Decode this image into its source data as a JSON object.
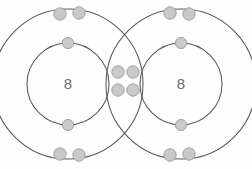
{
  "figure": {
    "background_color": "#fdfdfd",
    "ring_color": "#58585a",
    "electron_fill": "#c9c9c9",
    "electron_stroke": "#9a9a9a",
    "label_color": "#6d6d6f"
  },
  "atoms": {
    "left": {
      "name": "oxygen-atom-left",
      "nucleus_label": "8",
      "nucleus_cx": 68,
      "nucleus_cy": 84,
      "inner_shell_radius": 41,
      "outer_shell_radius": 75
    },
    "right": {
      "name": "oxygen-atom-right",
      "nucleus_label": "8",
      "nucleus_cx": 181,
      "nucleus_cy": 84,
      "inner_shell_radius": 41,
      "outer_shell_radius": 75
    }
  },
  "electrons": {
    "left_inner": [
      {
        "cx": 68,
        "cy": 43,
        "r": 5.6
      },
      {
        "cx": 68,
        "cy": 125,
        "r": 5.6
      }
    ],
    "left_outer": [
      {
        "cx": 60,
        "cy": 14,
        "r": 6.2
      },
      {
        "cx": 79,
        "cy": 13,
        "r": 6.2
      },
      {
        "cx": 60,
        "cy": 154,
        "r": 6.2
      },
      {
        "cx": 79,
        "cy": 155,
        "r": 6.2
      }
    ],
    "right_inner": [
      {
        "cx": 181,
        "cy": 43,
        "r": 5.6
      },
      {
        "cx": 181,
        "cy": 125,
        "r": 5.6
      }
    ],
    "right_outer": [
      {
        "cx": 170,
        "cy": 13,
        "r": 6.2
      },
      {
        "cx": 189,
        "cy": 14,
        "r": 6.2
      },
      {
        "cx": 170,
        "cy": 155,
        "r": 6.2
      },
      {
        "cx": 189,
        "cy": 154,
        "r": 6.2
      }
    ],
    "shared_bonding_pair": [
      {
        "cx": 118,
        "cy": 72,
        "r": 6.2
      },
      {
        "cx": 133,
        "cy": 72,
        "r": 6.2
      },
      {
        "cx": 118,
        "cy": 90,
        "r": 6.2
      },
      {
        "cx": 133,
        "cy": 90,
        "r": 6.2
      }
    ]
  },
  "counts": {
    "shared_electrons": 4,
    "bond_type": "double covalent bond"
  }
}
